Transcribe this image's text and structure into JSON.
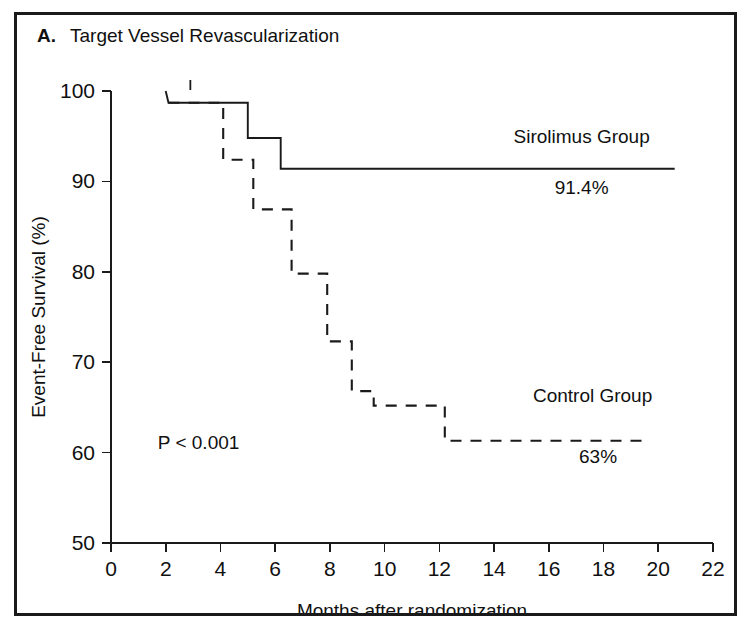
{
  "figure": {
    "panel_letter": "A.",
    "panel_title": "Target Vessel Revascularization"
  },
  "chart_data": {
    "type": "line",
    "title": "Target Vessel Revascularization",
    "subtitle": "",
    "xlabel": "Months after randomization",
    "ylabel": "Event-Free Survival (%)",
    "xlim": [
      0,
      22
    ],
    "ylim": [
      50,
      100
    ],
    "xticks": [
      0,
      2,
      4,
      6,
      8,
      10,
      12,
      14,
      16,
      18,
      20,
      22
    ],
    "yticks": [
      50,
      60,
      70,
      80,
      90,
      100
    ],
    "grid": false,
    "legend_position": "inline-annotation",
    "annotations": [
      {
        "text": "Sirolimus Group",
        "x": 17.2,
        "y": 94.3
      },
      {
        "text": "91.4%",
        "x": 17.2,
        "y": 88.6
      },
      {
        "text": "Control Group",
        "x": 17.6,
        "y": 65.6
      },
      {
        "text": "63%",
        "x": 17.8,
        "y": 58.8
      },
      {
        "text": "P < 0.001",
        "x": 3.2,
        "y": 60.4
      }
    ],
    "series": [
      {
        "name": "Sirolimus Group",
        "style": "solid",
        "final_value": 91.4,
        "final_label": "91.4%",
        "steps": [
          {
            "month": 2.0,
            "survival": 100.0
          },
          {
            "month": 2.1,
            "survival": 98.7
          },
          {
            "month": 5.0,
            "survival": 98.7
          },
          {
            "month": 5.0,
            "survival": 94.8
          },
          {
            "month": 6.2,
            "survival": 94.8
          },
          {
            "month": 6.2,
            "survival": 91.4
          },
          {
            "month": 20.6,
            "survival": 91.4
          }
        ],
        "censor_marks": [
          {
            "month": 2.9,
            "survival": 100.0
          }
        ]
      },
      {
        "name": "Control Group",
        "style": "dashed",
        "final_value": 63.0,
        "final_label": "63%",
        "steps": [
          {
            "month": 2.1,
            "survival": 98.7
          },
          {
            "month": 4.1,
            "survival": 98.7
          },
          {
            "month": 4.1,
            "survival": 92.4
          },
          {
            "month": 5.2,
            "survival": 92.4
          },
          {
            "month": 5.2,
            "survival": 86.9
          },
          {
            "month": 6.6,
            "survival": 86.9
          },
          {
            "month": 6.6,
            "survival": 79.8
          },
          {
            "month": 7.9,
            "survival": 79.8
          },
          {
            "month": 7.9,
            "survival": 72.3
          },
          {
            "month": 8.8,
            "survival": 72.3
          },
          {
            "month": 8.8,
            "survival": 66.8
          },
          {
            "month": 9.6,
            "survival": 66.8
          },
          {
            "month": 9.6,
            "survival": 65.2
          },
          {
            "month": 12.2,
            "survival": 65.2
          },
          {
            "month": 12.2,
            "survival": 61.3
          },
          {
            "month": 19.6,
            "survival": 61.3
          }
        ],
        "censor_marks": []
      }
    ]
  }
}
